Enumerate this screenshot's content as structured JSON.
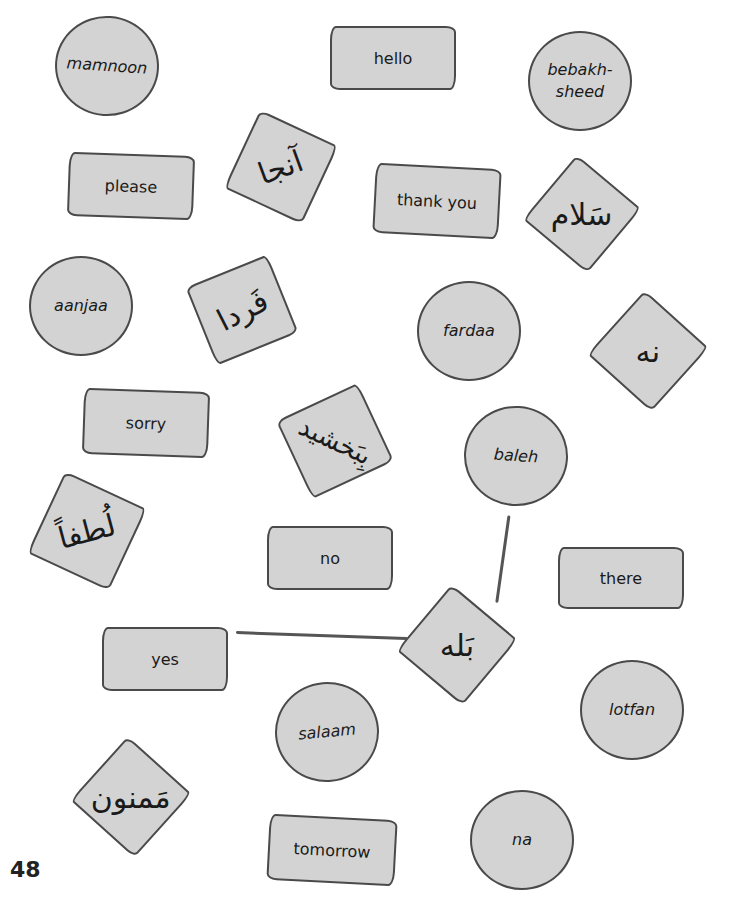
{
  "page_number": "48",
  "circles": [
    {
      "id": "mamnoon",
      "text": "mamnoon"
    },
    {
      "id": "bebakhsheed",
      "text": "bebakh-\nsheed"
    },
    {
      "id": "aanjaa",
      "text": "aanjaa"
    },
    {
      "id": "fardaa",
      "text": "fardaa"
    },
    {
      "id": "baleh",
      "text": "baleh"
    },
    {
      "id": "lotfan",
      "text": "lotfan"
    },
    {
      "id": "salaam",
      "text": "salaam"
    },
    {
      "id": "na",
      "text": "na"
    }
  ],
  "english_cards": [
    {
      "id": "hello",
      "text": "hello"
    },
    {
      "id": "please",
      "text": "please"
    },
    {
      "id": "thank-you",
      "text": "thank you"
    },
    {
      "id": "sorry",
      "text": "sorry"
    },
    {
      "id": "no",
      "text": "no"
    },
    {
      "id": "there",
      "text": "there"
    },
    {
      "id": "yes",
      "text": "yes"
    },
    {
      "id": "tomorrow",
      "text": "tomorrow"
    }
  ],
  "persian_cards": [
    {
      "id": "aanjaa-persian",
      "text": "آنجا"
    },
    {
      "id": "salaam-persian",
      "text": "سَلام"
    },
    {
      "id": "fardaa-persian",
      "text": "فَردا"
    },
    {
      "id": "na-persian",
      "text": "نه"
    },
    {
      "id": "bebakhsheed-persian",
      "text": "بِبَخشید"
    },
    {
      "id": "lotfan-persian",
      "text": "لُطفاً"
    },
    {
      "id": "baleh-persian",
      "text": "بَله"
    },
    {
      "id": "mamnoon-persian",
      "text": "مَمنون"
    }
  ],
  "connector_lines": [
    {
      "from": "yes",
      "to": "baleh-persian"
    },
    {
      "from": "baleh",
      "to": "baleh-persian"
    }
  ]
}
